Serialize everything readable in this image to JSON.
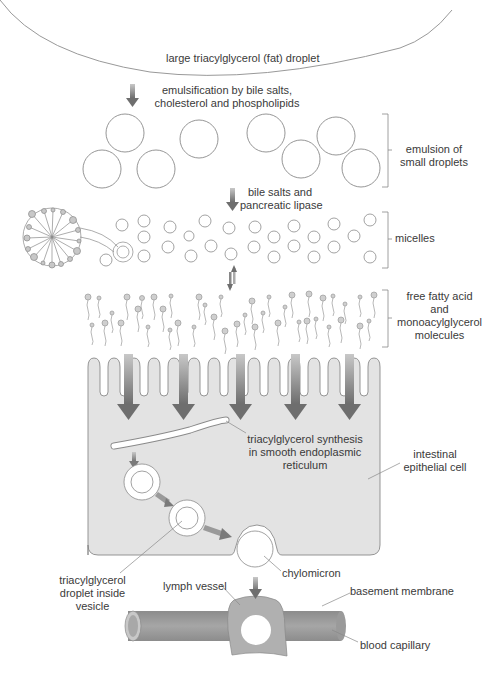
{
  "labels": {
    "fat_droplet": "large triacylglycerol (fat) droplet",
    "emulsification_1": "emulsification by bile salts,",
    "emulsification_2": "cholesterol and phospholipids",
    "emulsion_1": "emulsion of",
    "emulsion_2": "small droplets",
    "lipase_1": "bile salts and",
    "lipase_2": "pancreatic lipase",
    "micelles": "micelles",
    "ffa_1": "free fatty acid",
    "ffa_2": "and",
    "ffa_3": "monoacylglycerol",
    "ffa_4": "molecules",
    "synthesis_1": "triacylglycerol synthesis",
    "synthesis_2": "in smooth endoplasmic",
    "synthesis_3": "reticulum",
    "cell_1": "intestinal",
    "cell_2": "epithelial cell",
    "vesicle_1": "triacylglycerol",
    "vesicle_2": "droplet  inside",
    "vesicle_3": "vesicle",
    "chylomicron": "chylomicron",
    "lymph": "lymph vessel",
    "basement": "basement membrane",
    "capillary": "blood capillary"
  },
  "colors": {
    "cell_fill": "#e3e3e3",
    "outline": "#8a8a8a",
    "arrow": "#7a7a7a",
    "vessel": "#999999",
    "lymph": "#b0b0b0"
  }
}
